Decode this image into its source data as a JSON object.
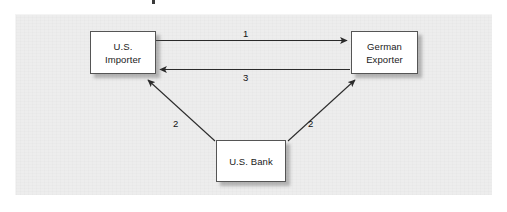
{
  "figure": {
    "type": "flow-diagram",
    "background_color": "#ededed",
    "page_color": "#ffffff",
    "node_fill": "#ffffff",
    "node_border": "#555555",
    "line_color": "#333333"
  },
  "nodes": [
    {
      "id": "importer",
      "name": "us-importer",
      "lines": [
        "U.S.",
        "Importer"
      ],
      "x": 90,
      "y": 31,
      "w": 66,
      "h": 43
    },
    {
      "id": "exporter",
      "name": "german-exporter",
      "lines": [
        "German",
        "Exporter"
      ],
      "x": 351,
      "y": 31,
      "w": 67,
      "h": 43
    },
    {
      "id": "bank",
      "name": "us-bank",
      "lines": [
        "U.S. Bank"
      ],
      "x": 216,
      "y": 140,
      "w": 70,
      "h": 42
    }
  ],
  "edges": [
    {
      "id": "e1",
      "label": "1",
      "from": "importer",
      "to": "exporter",
      "direction": "right",
      "style": "straight-horizontal"
    },
    {
      "id": "e3",
      "label": "3",
      "from": "exporter",
      "to": "importer",
      "direction": "left",
      "style": "straight-horizontal"
    },
    {
      "id": "e2a",
      "label": "2",
      "from": "bank",
      "to": "importer",
      "direction": "up-left",
      "style": "diagonal"
    },
    {
      "id": "e2b",
      "label": "2",
      "from": "bank",
      "to": "exporter",
      "direction": "up-right",
      "style": "diagonal"
    }
  ],
  "labels": {
    "edge_1": "1",
    "edge_3": "3",
    "edge_2_left": "2",
    "edge_2_right": "2"
  }
}
